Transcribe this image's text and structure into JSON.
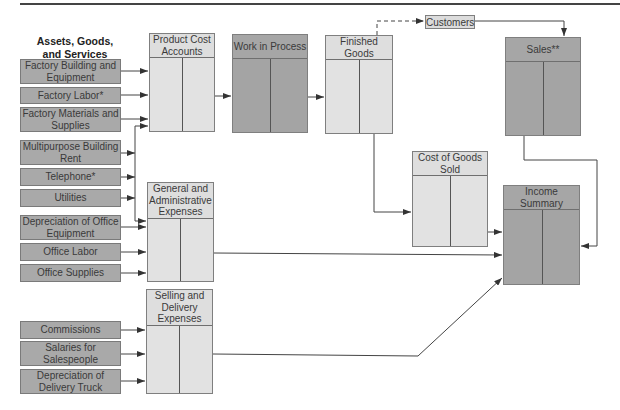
{
  "diagram": {
    "heading": "Assets, Goods, and Services",
    "heading_lines": [
      "Assets, Goods,",
      "and Services"
    ],
    "sources": [
      {
        "label": "Factory Building and Equipment",
        "group": "product"
      },
      {
        "label": "Factory Labor*",
        "group": "product"
      },
      {
        "label": "Factory Materials and Supplies",
        "group": "product"
      },
      {
        "label": "Multipurpose Building Rent",
        "group": "shared"
      },
      {
        "label": "Telephone*",
        "group": "shared"
      },
      {
        "label": "Utilities",
        "group": "shared"
      },
      {
        "label": "Depreciation of Office Equipment",
        "group": "admin"
      },
      {
        "label": "Office Labor",
        "group": "admin"
      },
      {
        "label": "Office Supplies",
        "group": "admin"
      },
      {
        "label": "Commissions",
        "group": "selling"
      },
      {
        "label": "Salaries for Salespeople",
        "group": "selling"
      },
      {
        "label": "Depreciation of Delivery Truck",
        "group": "selling"
      }
    ],
    "accounts": {
      "product_cost": "Product Cost Accounts",
      "work_in_process": "Work in Process",
      "finished_goods": "Finished Goods",
      "customers": "Customers",
      "sales": "Sales**",
      "cost_of_goods_sold": "Cost of Goods Sold",
      "general_admin": "General and Administrative Expenses",
      "selling_delivery": "Selling and Delivery Expenses",
      "income_summary": "Income Summary"
    },
    "flows": [
      {
        "from": "Factory Building and Equipment",
        "to": "Product Cost Accounts"
      },
      {
        "from": "Factory Labor*",
        "to": "Product Cost Accounts"
      },
      {
        "from": "Factory Materials and Supplies",
        "to": "Product Cost Accounts"
      },
      {
        "from": "Multipurpose Building Rent",
        "to": "Product Cost Accounts / General and Administrative Expenses"
      },
      {
        "from": "Telephone*",
        "to": "Product Cost Accounts / General and Administrative Expenses"
      },
      {
        "from": "Utilities",
        "to": "Product Cost Accounts / General and Administrative Expenses"
      },
      {
        "from": "Depreciation of Office Equipment",
        "to": "General and Administrative Expenses"
      },
      {
        "from": "Office Labor",
        "to": "General and Administrative Expenses"
      },
      {
        "from": "Office Supplies",
        "to": "General and Administrative Expenses"
      },
      {
        "from": "Commissions",
        "to": "Selling and Delivery Expenses"
      },
      {
        "from": "Salaries for Salespeople",
        "to": "Selling and Delivery Expenses"
      },
      {
        "from": "Depreciation of Delivery Truck",
        "to": "Selling and Delivery Expenses"
      },
      {
        "from": "Product Cost Accounts",
        "to": "Work in Process"
      },
      {
        "from": "Work in Process",
        "to": "Finished Goods"
      },
      {
        "from": "Finished Goods",
        "to": "Customers",
        "style": "dashed"
      },
      {
        "from": "Customers",
        "to": "Sales**"
      },
      {
        "from": "Finished Goods",
        "to": "Cost of Goods Sold"
      },
      {
        "from": "Cost of Goods Sold",
        "to": "Income Summary"
      },
      {
        "from": "Sales**",
        "to": "Income Summary"
      },
      {
        "from": "General and Administrative Expenses",
        "to": "Income Summary"
      },
      {
        "from": "Selling and Delivery Expenses",
        "to": "Income Summary"
      }
    ]
  }
}
